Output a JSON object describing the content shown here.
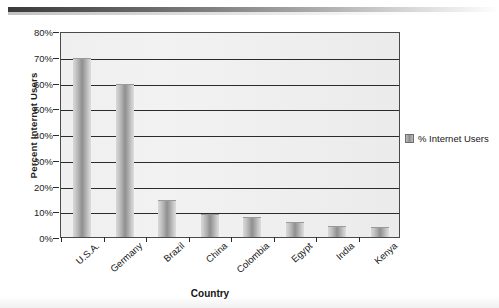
{
  "chart_data": {
    "type": "bar",
    "title": "",
    "xlabel": "Country",
    "ylabel": "Percent Internet Users",
    "categories": [
      "U.S.A.",
      "Germany",
      "Brazil",
      "China",
      "Colombia",
      "Egypt",
      "India",
      "Kenya"
    ],
    "series": [
      {
        "name": "% Internet Users",
        "values": [
          69,
          59,
          14,
          8.5,
          7.5,
          5.5,
          4,
          3.5
        ]
      }
    ],
    "ylim": [
      0,
      80
    ],
    "ytick_labels": [
      "80%",
      "70%",
      "60%",
      "50%",
      "40%",
      "30%",
      "20%",
      "10%",
      "0%"
    ],
    "ytick_values": [
      80,
      70,
      60,
      50,
      40,
      30,
      20,
      10,
      0
    ],
    "grid": true,
    "legend_position": "right",
    "legend_entries": [
      "% Internet Users"
    ],
    "bar_color": "#9a9a9a",
    "plot_background": "#eeeeee",
    "axis_color": "#2b2b2b"
  }
}
